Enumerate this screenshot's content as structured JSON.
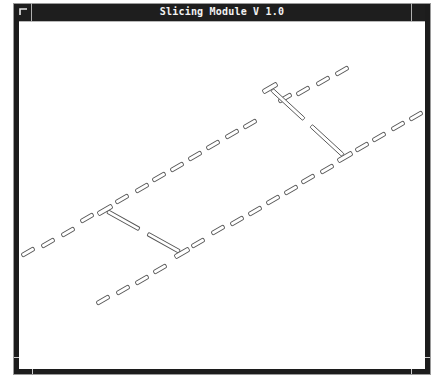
{
  "window": {
    "title": "Slicing Module V 1.0",
    "menu_icon": "window-menu-icon"
  },
  "canvas": {
    "description": "Isometric wireframe view of sliced parallel dashed rails with connecting crossbars",
    "colors": {
      "stroke": "#555555",
      "background": "#ffffff",
      "frame": "#1c1c1c",
      "titlebar": "#1e1e1e",
      "title_text": "#f2f2f2"
    },
    "rows": [
      {
        "name": "upper-rail",
        "dashes": [
          [
            28,
            252
          ],
          [
            48,
            243
          ],
          [
            68,
            232
          ],
          [
            87,
            218
          ],
          [
            122,
            199
          ],
          [
            142,
            188
          ],
          [
            159,
            177
          ],
          [
            177,
            167
          ],
          [
            195,
            156
          ],
          [
            213,
            145
          ],
          [
            232,
            134
          ],
          [
            250,
            124
          ],
          [
            285,
            98
          ],
          [
            303,
            91
          ],
          [
            323,
            81
          ],
          [
            342,
            71
          ]
        ],
        "junctions": [
          [
            105,
            210
          ],
          [
            270,
            88
          ]
        ]
      },
      {
        "name": "lower-rail",
        "dashes": [
          [
            103,
            300
          ],
          [
            123,
            290
          ],
          [
            142,
            280
          ],
          [
            160,
            269
          ],
          [
            198,
            243
          ],
          [
            218,
            230
          ],
          [
            237,
            221
          ],
          [
            255,
            211
          ],
          [
            273,
            200
          ],
          [
            291,
            190
          ],
          [
            308,
            179
          ],
          [
            327,
            169
          ],
          [
            362,
            147
          ],
          [
            379,
            137
          ],
          [
            398,
            126
          ],
          [
            416,
            116
          ]
        ],
        "junctions": [
          [
            182,
            253
          ],
          [
            345,
            157
          ]
        ]
      }
    ],
    "crossbars": [
      {
        "from": [
          105,
          210
        ],
        "to": [
          182,
          253
        ]
      },
      {
        "from": [
          270,
          88
        ],
        "to": [
          345,
          157
        ]
      }
    ]
  }
}
